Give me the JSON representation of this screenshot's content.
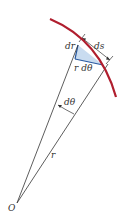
{
  "diagram": {
    "colors": {
      "arc": "#b01e2e",
      "lines": "#333333",
      "triangle_fill": "#c9dcf0",
      "triangle_edge": "#2a5aa0",
      "background": "#ffffff"
    },
    "labels": {
      "dr": "dr",
      "ds": "ds",
      "r_dtheta": "r dθ",
      "dtheta": "dθ",
      "r": "r",
      "origin": "O"
    }
  }
}
